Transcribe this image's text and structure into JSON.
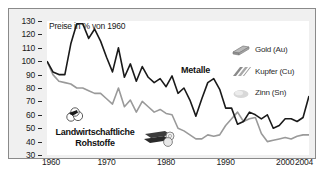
{
  "figure": {
    "background": "#f0f0f0",
    "plot_background": "#ffffff",
    "border_color": "#8a8a8a"
  },
  "axis_title": "Preise in % von 1960",
  "group_label_metals": "Metalle",
  "group_label_agri_line1": "Landwirtschaftliche",
  "group_label_agri_line2": "Rohstoffe",
  "legend": {
    "entries": [
      {
        "label": "Gold (Au)",
        "icon": "gold-bar-icon",
        "color": "#9a9a9a"
      },
      {
        "label": "Kupfer (Cu)",
        "icon": "copper-wire-icon",
        "color": "#8a8a8a"
      },
      {
        "label": "Zinn (Sn)",
        "icon": "tin-blob-icon",
        "color": "#cfcfcf"
      }
    ]
  },
  "chart_data": {
    "type": "line",
    "title": "Preise in % von 1960",
    "xlabel": "",
    "ylabel": "Preise in % von 1960",
    "xlim": [
      1960,
      2004
    ],
    "ylim": [
      30,
      130
    ],
    "ytick_labels": [
      "130",
      "120",
      "110",
      "100",
      "90",
      "80",
      "70",
      "60",
      "50",
      "40",
      "30"
    ],
    "ytick_values": [
      130,
      120,
      110,
      100,
      90,
      80,
      70,
      60,
      50,
      40,
      30
    ],
    "xtick_labels": [
      "1960",
      "1970",
      "1980",
      "1990",
      "2000",
      "2004"
    ],
    "xtick_values": [
      1960,
      1970,
      1980,
      1990,
      2000,
      2004
    ],
    "grid": false,
    "legend_position": "upper-right",
    "x": [
      1960,
      1961,
      1962,
      1963,
      1964,
      1965,
      1966,
      1967,
      1968,
      1969,
      1970,
      1971,
      1972,
      1973,
      1974,
      1975,
      1976,
      1977,
      1978,
      1979,
      1980,
      1981,
      1982,
      1983,
      1984,
      1985,
      1986,
      1987,
      1988,
      1989,
      1990,
      1991,
      1992,
      1993,
      1994,
      1995,
      1996,
      1997,
      1998,
      1999,
      2000,
      2001,
      2002,
      2003,
      2004
    ],
    "series": [
      {
        "name": "Metalle",
        "color": "#1a1a1a",
        "values": [
          100,
          92,
          90,
          90,
          113,
          128,
          128,
          117,
          124,
          115,
          103,
          92,
          110,
          88,
          98,
          85,
          96,
          88,
          84,
          87,
          81,
          89,
          76,
          80,
          71,
          59,
          72,
          84,
          87,
          79,
          65,
          65,
          53,
          55,
          62,
          60,
          57,
          60,
          50,
          52,
          57,
          57,
          55,
          58,
          74
        ]
      },
      {
        "name": "Landwirtschaftliche Rohstoffe",
        "color": "#9a9a9a",
        "values": [
          100,
          90,
          85,
          84,
          83,
          80,
          80,
          78,
          76,
          76,
          72,
          68,
          80,
          66,
          71,
          62,
          70,
          66,
          62,
          64,
          61,
          60,
          50,
          48,
          45,
          42,
          42,
          45,
          44,
          45,
          52,
          57,
          62,
          55,
          57,
          58,
          46,
          40,
          41,
          42,
          43,
          42,
          44,
          45,
          45
        ]
      }
    ]
  }
}
